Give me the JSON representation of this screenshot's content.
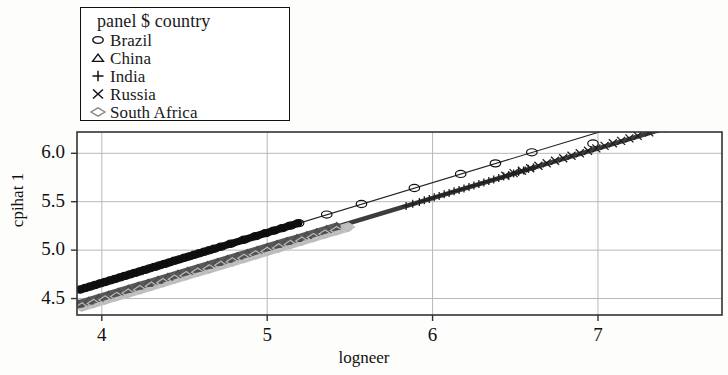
{
  "chart_data": {
    "type": "scatter",
    "title": "",
    "xlabel": "logneer",
    "ylabel": "cpihat 1",
    "xlim": [
      3.85,
      7.75
    ],
    "ylim": [
      4.33,
      6.22
    ],
    "xticks": [
      4,
      5,
      6,
      7
    ],
    "xtick_labels": [
      "4",
      "5",
      "6",
      "7"
    ],
    "yticks": [
      4.5,
      5.0,
      5.5,
      6.0
    ],
    "ytick_labels": [
      "4.5",
      "5.0",
      "5.5",
      "6.0"
    ],
    "grid": true,
    "legend_position": "top-left-outside",
    "legend_title": "panel $ country",
    "series": [
      {
        "name": "Brazil",
        "marker": "circle",
        "color": "#111111",
        "fit_line": {
          "intercept": 2.586,
          "slope": 0.5185
        },
        "x": [
          3.87,
          3.9,
          3.93,
          3.96,
          3.99,
          4.02,
          4.05,
          4.08,
          4.11,
          4.14,
          4.17,
          4.2,
          4.23,
          4.26,
          4.29,
          4.32,
          4.35,
          4.38,
          4.41,
          4.44,
          4.47,
          4.5,
          4.53,
          4.56,
          4.59,
          4.62,
          4.65,
          4.68,
          4.72,
          4.78,
          4.86,
          4.93,
          4.99,
          5.04,
          5.09,
          5.14,
          5.19,
          5.36,
          5.57,
          5.89,
          6.17,
          6.38,
          6.6,
          6.97
        ],
        "y": [
          4.593,
          4.609,
          4.624,
          4.64,
          4.656,
          4.671,
          4.687,
          4.702,
          4.718,
          4.734,
          4.749,
          4.765,
          4.78,
          4.796,
          4.812,
          4.827,
          4.843,
          4.858,
          4.874,
          4.89,
          4.905,
          4.921,
          4.936,
          4.952,
          4.968,
          4.983,
          4.999,
          5.014,
          5.035,
          5.066,
          5.107,
          5.144,
          5.175,
          5.201,
          5.227,
          5.253,
          5.279,
          5.367,
          5.476,
          5.642,
          5.787,
          5.896,
          6.01,
          6.102
        ]
      },
      {
        "name": "China",
        "marker": "triangle",
        "color": "#4a4a4a",
        "fit_line": {
          "intercept": 2.466,
          "slope": 0.512
        },
        "x": [
          3.86,
          3.92,
          3.98,
          4.04,
          4.1,
          4.16,
          4.22,
          4.28,
          4.34,
          4.4,
          4.46,
          4.52,
          4.58,
          4.64,
          4.7,
          4.76,
          4.82,
          4.88,
          4.94,
          5.0,
          5.06,
          5.12,
          5.18,
          5.24,
          5.3,
          5.36,
          5.42
        ],
        "y": [
          4.443,
          4.474,
          4.504,
          4.535,
          4.566,
          4.597,
          4.628,
          4.658,
          4.689,
          4.72,
          4.751,
          4.782,
          4.812,
          4.843,
          4.874,
          4.905,
          4.936,
          4.966,
          4.997,
          5.028,
          5.059,
          5.09,
          5.12,
          5.151,
          5.182,
          5.213,
          5.244
        ]
      },
      {
        "name": "India",
        "marker": "plus",
        "color": "#1f1f1f",
        "fit_line": {
          "intercept": 2.466,
          "slope": 0.512
        },
        "x": [
          5.84,
          5.88,
          5.92,
          5.95,
          5.98,
          6.01,
          6.04,
          6.07,
          6.1,
          6.13,
          6.16,
          6.19,
          6.22,
          6.25,
          6.28,
          6.31,
          6.34,
          6.37,
          6.4,
          6.43,
          6.46,
          6.49,
          6.52,
          6.55,
          6.58,
          6.61
        ],
        "y": [
          5.457,
          5.478,
          5.498,
          5.514,
          5.529,
          5.545,
          5.56,
          5.576,
          5.591,
          5.607,
          5.622,
          5.637,
          5.653,
          5.668,
          5.684,
          5.699,
          5.715,
          5.73,
          5.746,
          5.761,
          5.777,
          5.792,
          5.808,
          5.823,
          5.839,
          5.854
        ]
      },
      {
        "name": "Russia",
        "marker": "cross",
        "color": "#1f1f1f",
        "fit_line": {
          "intercept": 2.466,
          "slope": 0.512
        },
        "x": [
          6.44,
          6.49,
          6.54,
          6.59,
          6.64,
          6.69,
          6.74,
          6.79,
          6.84,
          6.89,
          6.94,
          6.99,
          7.04,
          7.09,
          7.14,
          7.19,
          7.24,
          7.31,
          7.39,
          7.47,
          7.55,
          7.62
        ],
        "y": [
          5.769,
          5.795,
          5.82,
          5.846,
          5.872,
          5.897,
          5.923,
          5.949,
          5.974,
          6.0,
          6.026,
          6.051,
          6.077,
          6.103,
          6.128,
          6.154,
          6.18,
          6.216,
          6.257,
          6.298,
          6.339,
          6.375
        ]
      },
      {
        "name": "South Africa",
        "marker": "diamond",
        "color": "#b9b9b9",
        "fit_line": {
          "intercept": 2.466,
          "slope": 0.512
        },
        "x": [
          3.88,
          3.95,
          4.02,
          4.09,
          4.16,
          4.23,
          4.3,
          4.37,
          4.44,
          4.51,
          4.58,
          4.65,
          4.72,
          4.79,
          4.86,
          4.93,
          5.0,
          5.07,
          5.14,
          5.21,
          5.28,
          5.35,
          5.42,
          5.49
        ],
        "y": [
          4.413,
          4.449,
          4.485,
          4.521,
          4.556,
          4.592,
          4.628,
          4.664,
          4.7,
          4.736,
          4.772,
          4.807,
          4.843,
          4.879,
          4.915,
          4.951,
          4.987,
          5.023,
          5.058,
          5.094,
          5.13,
          5.166,
          5.202,
          5.238
        ]
      }
    ]
  },
  "axes": {
    "xlabel": "logneer",
    "ylabel": "cpihat 1",
    "xtick_labels": [
      "4",
      "5",
      "6",
      "7"
    ],
    "ytick_labels": [
      "4.5",
      "5.0",
      "5.5",
      "6.0"
    ]
  },
  "legend": {
    "title": "panel $ country",
    "items": [
      {
        "label": "Brazil",
        "marker": "circle-icon",
        "color": "#111111"
      },
      {
        "label": "China",
        "marker": "triangle-icon",
        "color": "#4a4a4a"
      },
      {
        "label": "India",
        "marker": "plus-icon",
        "color": "#1f1f1f"
      },
      {
        "label": "Russia",
        "marker": "cross-icon",
        "color": "#1f1f1f"
      },
      {
        "label": "South Africa",
        "marker": "diamond-icon",
        "color": "#9a9a9a"
      }
    ]
  }
}
